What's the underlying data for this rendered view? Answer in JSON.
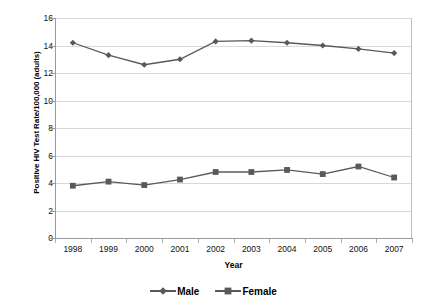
{
  "chart_data": {
    "type": "line",
    "title": "",
    "xlabel": "Year",
    "ylabel": "Positive HIV Test Rate/100,000 (adults)",
    "categories": [
      "1998",
      "1999",
      "2000",
      "2001",
      "2002",
      "2003",
      "2004",
      "2005",
      "2006",
      "2007"
    ],
    "series": [
      {
        "name": "Male",
        "marker": "diamond",
        "color": "#595959",
        "values": [
          14.2,
          13.3,
          12.6,
          13.0,
          14.3,
          14.35,
          14.2,
          14.0,
          13.75,
          13.45
        ]
      },
      {
        "name": "Female",
        "marker": "square",
        "color": "#595959",
        "values": [
          3.8,
          4.1,
          3.85,
          4.25,
          4.8,
          4.8,
          4.95,
          4.65,
          5.2,
          4.4
        ]
      }
    ],
    "ylim": [
      0,
      16
    ],
    "yticks": [
      "0",
      "2",
      "4",
      "6",
      "8",
      "10",
      "12",
      "14",
      "16"
    ],
    "xlim_categories": 10,
    "grid": "horizontal",
    "legend_position": "bottom"
  },
  "legend": {
    "entries": [
      {
        "label": "Male"
      },
      {
        "label": "Female"
      }
    ]
  },
  "colors": {
    "series": "#595959",
    "gridline": "#d9d9d9",
    "axis": "#9a9a9a",
    "text": "#111111"
  }
}
